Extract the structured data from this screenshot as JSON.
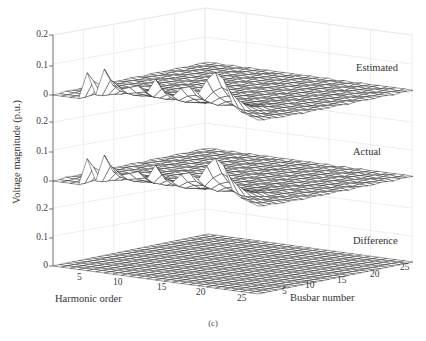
{
  "chart_data": {
    "type": "surface3d_stack",
    "caption": "(c)",
    "ylabel": "Voltage magnitude (p.u.)",
    "x_axis": {
      "label": "Harmonic order",
      "ticks": [
        5,
        10,
        15,
        20,
        25
      ],
      "range": [
        1,
        25
      ]
    },
    "y_axis": {
      "label": "Busbar number",
      "ticks": [
        5,
        10,
        15,
        20,
        25
      ],
      "range": [
        1,
        25
      ]
    },
    "z_axis": {
      "ticks": [
        0,
        0.1,
        0.2
      ],
      "range": [
        0,
        0.2
      ]
    },
    "grid": true,
    "panels": [
      {
        "name": "Estimated",
        "zero_y": 95,
        "peak_scale": 1.0
      },
      {
        "name": "Actual",
        "zero_y": 181,
        "peak_scale": 1.0
      },
      {
        "name": "Difference",
        "zero_y": 266,
        "peak_scale": 0.0
      }
    ],
    "peaks_by_harmonic_busbar1": {
      "harmonics": [
        1,
        2,
        3,
        4,
        5,
        6,
        7,
        8,
        9,
        10,
        11,
        12,
        13,
        14,
        15,
        16,
        17,
        18,
        19,
        20,
        21,
        22,
        23,
        24,
        25
      ],
      "values": [
        0.0,
        0.0,
        0.0,
        0.0,
        0.09,
        0.02,
        0.11,
        0.06,
        0.05,
        0.06,
        0.07,
        0.05,
        0.1,
        0.06,
        0.05,
        0.08,
        0.09,
        0.07,
        0.12,
        0.15,
        0.13,
        0.05,
        0.03,
        0.02,
        0.01
      ]
    }
  },
  "labels": {
    "left_ticks": [
      {
        "text": "0.2",
        "y": 35
      },
      {
        "text": "0.1",
        "y": 66
      },
      {
        "text": "0",
        "y": 95
      },
      {
        "text": "0.2",
        "y": 122
      },
      {
        "text": "0.1",
        "y": 152
      },
      {
        "text": "0",
        "y": 181
      },
      {
        "text": "0.2",
        "y": 209
      },
      {
        "text": "0.1",
        "y": 238
      },
      {
        "text": "0",
        "y": 266
      }
    ],
    "harmonic_ticks": [
      {
        "text": "5",
        "x": 80,
        "y": 277
      },
      {
        "text": "10",
        "x": 113,
        "y": 282
      },
      {
        "text": "15",
        "x": 158,
        "y": 286
      },
      {
        "text": "20",
        "x": 197,
        "y": 290
      },
      {
        "text": "25",
        "x": 238,
        "y": 295
      }
    ],
    "busbar_ticks": [
      {
        "text": "5",
        "x": 284,
        "y": 290
      },
      {
        "text": "10",
        "x": 310,
        "y": 283
      },
      {
        "text": "15",
        "x": 343,
        "y": 277
      },
      {
        "text": "20",
        "x": 375,
        "y": 270
      },
      {
        "text": "25",
        "x": 406,
        "y": 265
      }
    ],
    "harmonic_title": "Harmonic order",
    "busbar_title": "Busbar number",
    "panel_names": [
      "Estimated",
      "Actual",
      "Difference"
    ]
  }
}
